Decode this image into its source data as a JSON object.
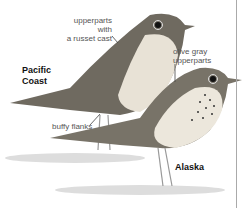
{
  "illustration": {
    "subject": "Swainson's Thrush subspecies comparison",
    "labels": {
      "upperparts_russet_line1": "upperparts with",
      "upperparts_russet_line2": "a russet cast",
      "olive_gray_line1": "olive gray",
      "olive_gray_line2": "upperparts",
      "buffy_flanks": "buffy flanks"
    },
    "regions": {
      "pacific_line1": "Pacific",
      "pacific_line2": "Coast",
      "alaska": "Alaska"
    },
    "colors": {
      "bird_upper": "#6f6a60",
      "bird_breast": "#e8e2d6",
      "label_text": "#555555",
      "region_text": "#111111",
      "divider": "#aaaaaa"
    }
  }
}
